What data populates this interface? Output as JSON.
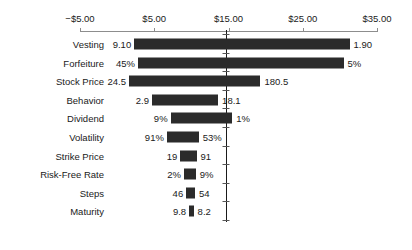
{
  "chart_data": {
    "type": "bar",
    "subtype": "tornado",
    "title": "",
    "xlabel": "",
    "ylabel": "",
    "xlim": [
      -5,
      35
    ],
    "grid": false,
    "legend": null,
    "axis_tick_labels": [
      "−$5.00",
      "$5.00",
      "$15.00",
      "$25.00",
      "$35.00"
    ],
    "axis_tick_values": [
      -5,
      5,
      15,
      25,
      35
    ],
    "base_case": 14.6,
    "categories": [
      "Vesting",
      "Forfeiture",
      "Stock Price",
      "Behavior",
      "Dividend",
      "Volatility",
      "Strike Price",
      "Risk-Free Rate",
      "Steps",
      "Maturity"
    ],
    "bars": [
      {
        "label": "Vesting",
        "low_label": "9.10",
        "high_label": "1.90",
        "span_start": 2.3,
        "span_end": 31.3
      },
      {
        "label": "Forfeiture",
        "low_label": "45%",
        "high_label": "5%",
        "span_start": 2.8,
        "span_end": 30.5
      },
      {
        "label": "Stock Price",
        "low_label": "24.5",
        "high_label": "180.5",
        "span_start": 1.6,
        "span_end": 19.3
      },
      {
        "label": "Behavior",
        "low_label": "2.9",
        "high_label": "18.1",
        "span_start": 4.7,
        "span_end": 13.6
      },
      {
        "label": "Dividend",
        "low_label": "9%",
        "high_label": "1%",
        "span_start": 7.2,
        "span_end": 15.5
      },
      {
        "label": "Volatility",
        "low_label": "91%",
        "high_label": "53%",
        "span_start": 6.7,
        "span_end": 11.0
      },
      {
        "label": "Strike Price",
        "low_label": "19",
        "high_label": "91",
        "span_start": 8.5,
        "span_end": 10.7
      },
      {
        "label": "Risk-Free Rate",
        "low_label": "2%",
        "high_label": "9%",
        "span_start": 9.0,
        "span_end": 10.6
      },
      {
        "label": "Steps",
        "low_label": "46",
        "high_label": "54",
        "span_start": 9.3,
        "span_end": 10.5
      },
      {
        "label": "Maturity",
        "low_label": "9.8",
        "high_label": "8.2",
        "span_start": 9.7,
        "span_end": 10.3
      }
    ]
  },
  "style": {
    "bar_color": "#2b2b2b",
    "axis_color": "#8d8d8d",
    "text_color": "#1a1a1a",
    "background": "#ffffff"
  }
}
